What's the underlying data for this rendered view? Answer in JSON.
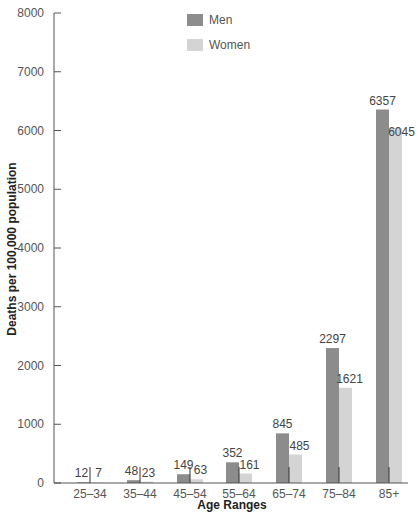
{
  "chart_data": {
    "type": "bar",
    "title": "",
    "xlabel": "Age Ranges",
    "ylabel": "Deaths per 100,000 population",
    "ylim": [
      0,
      8000
    ],
    "yticks": [
      0,
      1000,
      2000,
      3000,
      4000,
      5000,
      6000,
      7000,
      8000
    ],
    "grid": false,
    "legend_position": "top-center",
    "categories": [
      "25–34",
      "35–44",
      "45–54",
      "55–64",
      "65–74",
      "75–84",
      "85+"
    ],
    "series": [
      {
        "name": "Men",
        "color": "#8c8c8c",
        "values": [
          12,
          48,
          149,
          352,
          845,
          2297,
          6357
        ]
      },
      {
        "name": "Women",
        "color": "#d4d4d4",
        "values": [
          7,
          23,
          63,
          161,
          485,
          1621,
          6045
        ]
      }
    ]
  },
  "layout": {
    "axis_color": "#555555"
  }
}
